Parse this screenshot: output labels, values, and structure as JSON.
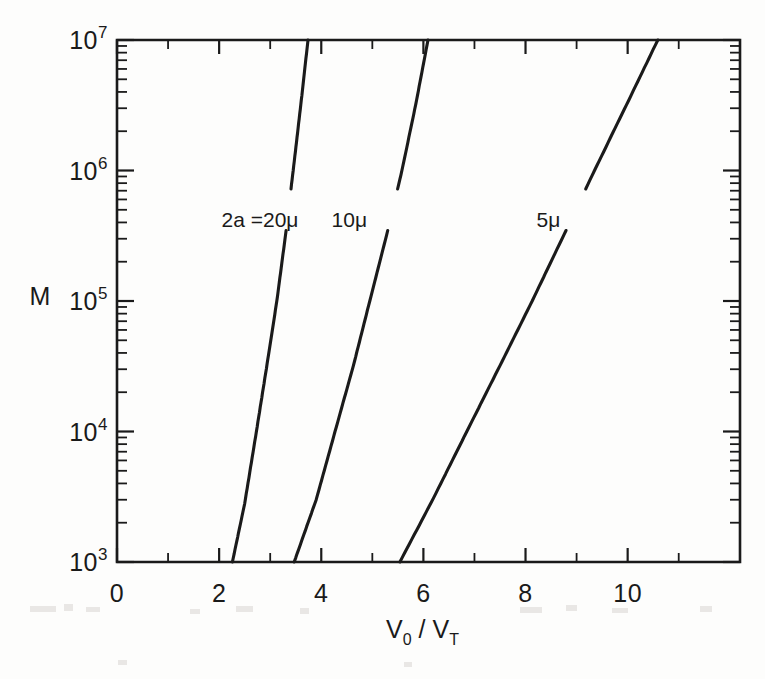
{
  "chart_data": {
    "type": "line",
    "title": "",
    "xlabel": "V0 / VT",
    "ylabel": "M",
    "xlabel_parts": {
      "v_main": "V",
      "v_sub": "0",
      "slash": "/",
      "v2_main": "V",
      "v2_sub": "T"
    },
    "xlim": [
      0,
      12.2
    ],
    "ylim": [
      1000,
      10000000
    ],
    "yscale": "log",
    "xscale": "linear",
    "grid": false,
    "legend": "inline-curve-labels",
    "x_ticks_major": [
      0,
      2,
      4,
      6,
      8,
      10
    ],
    "x_tick_labels": [
      "0",
      "2",
      "4",
      "6",
      "8",
      "10"
    ],
    "x_ticks_minor": [
      1,
      3,
      5,
      7,
      9,
      11
    ],
    "y_ticks_major": [
      1000,
      10000,
      100000,
      1000000,
      10000000
    ],
    "y_tick_labels": [
      {
        "base": "10",
        "exp": "3"
      },
      {
        "base": "10",
        "exp": "4"
      },
      {
        "base": "10",
        "exp": "5"
      },
      {
        "base": "10",
        "exp": "6"
      },
      {
        "base": "10",
        "exp": "7"
      }
    ],
    "series": [
      {
        "name": "2a =20μ",
        "label": "2a =20μ",
        "label_x": 2.8,
        "label_y": 420000,
        "points": [
          {
            "x": 2.26,
            "y": 1000
          },
          {
            "x": 2.5,
            "y": 2800
          },
          {
            "x": 2.73,
            "y": 10000
          },
          {
            "x": 2.94,
            "y": 33000
          },
          {
            "x": 3.13,
            "y": 100000
          },
          {
            "x": 3.3,
            "y": 320000
          },
          {
            "x": 3.45,
            "y": 1000000
          },
          {
            "x": 3.6,
            "y": 3200000
          },
          {
            "x": 3.74,
            "y": 10000000
          }
        ]
      },
      {
        "name": "10μ",
        "label": "10μ",
        "label_x": 4.55,
        "label_y": 420000,
        "points": [
          {
            "x": 3.47,
            "y": 1000
          },
          {
            "x": 3.9,
            "y": 3000
          },
          {
            "x": 4.27,
            "y": 10000
          },
          {
            "x": 4.63,
            "y": 32000
          },
          {
            "x": 4.95,
            "y": 100000
          },
          {
            "x": 5.28,
            "y": 320000
          },
          {
            "x": 5.58,
            "y": 1000000
          },
          {
            "x": 5.85,
            "y": 3200000
          },
          {
            "x": 6.09,
            "y": 10000000
          }
        ]
      },
      {
        "name": "5μ",
        "label": "5μ",
        "label_x": 8.45,
        "label_y": 420000,
        "points": [
          {
            "x": 5.54,
            "y": 1000
          },
          {
            "x": 6.2,
            "y": 3100
          },
          {
            "x": 6.85,
            "y": 10000
          },
          {
            "x": 7.5,
            "y": 32000
          },
          {
            "x": 8.13,
            "y": 100000
          },
          {
            "x": 8.75,
            "y": 320000
          },
          {
            "x": 9.35,
            "y": 1000000
          },
          {
            "x": 9.98,
            "y": 3200000
          },
          {
            "x": 10.59,
            "y": 10000000
          }
        ]
      }
    ]
  },
  "colors": {
    "ink": "#1a1a1a",
    "paper": "#fdfdfc"
  }
}
